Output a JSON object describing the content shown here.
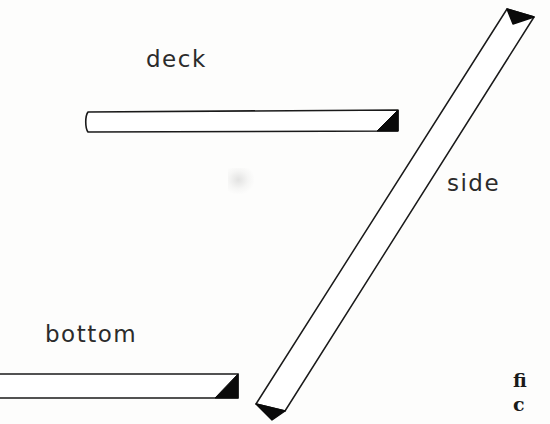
{
  "figure": {
    "background_color": "#fdfdfc",
    "ink_color": "#1a1a1a",
    "width": 550,
    "height": 424,
    "labels": {
      "deck": "deck",
      "side": "side",
      "bottom": "bottom"
    },
    "caption_fragment": {
      "line1": "fi",
      "line2": "c"
    },
    "members": [
      {
        "name": "deck",
        "orientation": "horizontal",
        "label": "deck",
        "outline_color": "#1a1a1a",
        "fill_color": "#ffffff",
        "end_cap_color": "#000000",
        "end_cap_side": "right",
        "clipped_at_edge": false
      },
      {
        "name": "side",
        "orientation": "diagonal",
        "label": "side",
        "outline_color": "#1a1a1a",
        "fill_color": "#ffffff",
        "end_cap_color": "#000000",
        "end_cap_side": "both",
        "clipped_at_edge": false
      },
      {
        "name": "bottom",
        "orientation": "horizontal",
        "label": "bottom",
        "outline_color": "#1a1a1a",
        "fill_color": "#ffffff",
        "end_cap_color": "#000000",
        "end_cap_side": "right",
        "clipped_at_edge": true
      }
    ]
  }
}
